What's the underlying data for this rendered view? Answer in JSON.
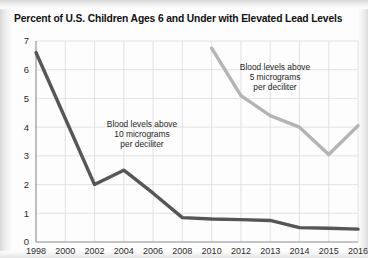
{
  "chart_data": {
    "type": "line",
    "title": "Percent of U.S. Children Ages 6 and Under with Elevated Lead Levels",
    "xlabel": "",
    "ylabel": "",
    "ylim": [
      0,
      7
    ],
    "yticks": [
      0,
      1,
      2,
      3,
      4,
      5,
      6,
      7
    ],
    "grid": true,
    "legend_position": "inline-annotation",
    "categories": [
      "1998",
      "2000",
      "2002",
      "2004",
      "2006",
      "2008",
      "2010",
      "2012",
      "2013",
      "2014",
      "2015",
      "2016"
    ],
    "series": [
      {
        "name": "Blood levels above 10 micrograms per deciliter",
        "color": "#565656",
        "values": [
          6.6,
          4.3,
          2.0,
          2.5,
          1.7,
          0.85,
          0.8,
          0.78,
          0.75,
          0.5,
          0.48,
          0.45
        ]
      },
      {
        "name": "Blood levels above 5 micrograms per deciliter",
        "color": "#b4b4b4",
        "values": [
          null,
          null,
          null,
          null,
          null,
          null,
          6.75,
          5.1,
          4.4,
          4.0,
          3.05,
          4.05
        ]
      }
    ],
    "annotations": [
      {
        "id": "annotation-10-micrograms",
        "lines": [
          "Blood levels above",
          "10 micrograms",
          "per deciliter"
        ],
        "x": 142,
        "y": 127
      },
      {
        "id": "annotation-5-micrograms",
        "lines": [
          "Blood levels above",
          "5 micrograms",
          "per deciliter"
        ],
        "x": 275,
        "y": 70
      }
    ]
  }
}
